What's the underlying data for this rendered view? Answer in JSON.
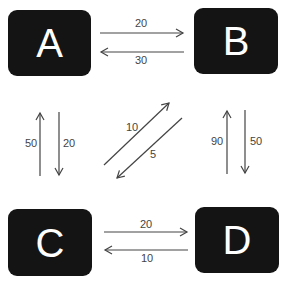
{
  "diagram": {
    "type": "flow-graph",
    "colors": {
      "node_fill": "#141414",
      "node_text": "#ffffff",
      "edge": "#444444",
      "label": "#444444",
      "background": "#ffffff"
    },
    "nodes": [
      {
        "id": "A",
        "label": "A"
      },
      {
        "id": "B",
        "label": "B"
      },
      {
        "id": "C",
        "label": "C"
      },
      {
        "id": "D",
        "label": "D"
      }
    ],
    "edges": [
      {
        "from": "A",
        "to": "B",
        "label": "20"
      },
      {
        "from": "B",
        "to": "A",
        "label": "30"
      },
      {
        "from": "C",
        "to": "A",
        "label": "50"
      },
      {
        "from": "A",
        "to": "C",
        "label": "20"
      },
      {
        "from": "C",
        "to": "B",
        "label": "10"
      },
      {
        "from": "B",
        "to": "C",
        "label": "5"
      },
      {
        "from": "D",
        "to": "B",
        "label": "90"
      },
      {
        "from": "B",
        "to": "D",
        "label": "50"
      },
      {
        "from": "C",
        "to": "D",
        "label": "20"
      },
      {
        "from": "D",
        "to": "C",
        "label": "10"
      }
    ]
  }
}
